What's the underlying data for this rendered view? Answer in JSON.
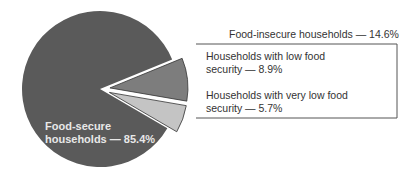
{
  "chart_data": {
    "type": "pie",
    "title": "",
    "slices": [
      {
        "label": "Food-secure households",
        "value": 85.4,
        "color": "#5a5a5a"
      },
      {
        "label": "Households with low food security",
        "value": 8.9,
        "color": "#7d7d7d",
        "exploded": true
      },
      {
        "label": "Households with very low food security",
        "value": 5.7,
        "color": "#c4c4c4",
        "exploded": true
      }
    ],
    "group": {
      "label": "Food-insecure households",
      "value": 14.6
    }
  },
  "labels": {
    "secure_line1": "Food-secure",
    "secure_line2": "households — 85.4%",
    "insecure": "Food-insecure households — 14.6%",
    "low_line1": "Households with low food",
    "low_line2": "security — 8.9%",
    "verylow_line1": "Households with very low food",
    "verylow_line2": "security — 5.7%"
  }
}
